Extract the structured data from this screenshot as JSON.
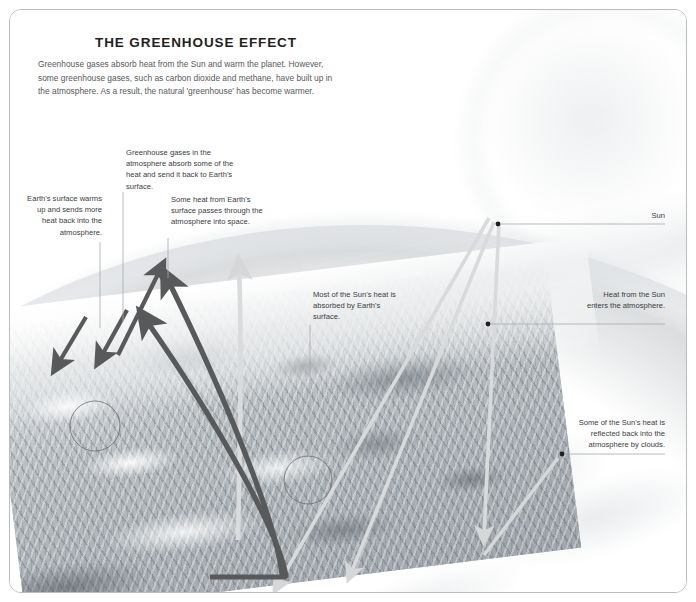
{
  "diagram": {
    "title": "THE GREENHOUSE EFFECT",
    "intro": "Greenhouse gases absorb heat from the Sun and warm the planet. However, some greenhouse gases, such as carbon dioxide and methane, have built up in the atmosphere. As a result, the natural 'greenhouse' has become warmer.",
    "background_subject": "earth-from-space-grayscale",
    "colors": {
      "title": "#231f20",
      "intro_text": "#58595b",
      "callout_text": "#3b3c3e",
      "leader_line": "#a7a9ac",
      "dark_arrow": "#58595b",
      "light_ray": "#d8dadc",
      "card_border": "#b9bcbe",
      "circle_marker": "#6d6e71"
    },
    "callouts": [
      {
        "id": "earth-surface-warms",
        "text": "Earth's surface warms up and sends more heat back into the atmosphere.",
        "align": "right"
      },
      {
        "id": "greenhouse-gases-absorb",
        "text": "Greenhouse gases in the atmosphere absorb some of the heat and send it back to Earth's surface.",
        "align": "left"
      },
      {
        "id": "heat-passes-into-space",
        "text": "Some heat from Earth's surface passes through the atmosphere into space.",
        "align": "left"
      },
      {
        "id": "most-heat-absorbed",
        "text": "Most of the Sun's heat is absorbed by Earth's surface.",
        "align": "left"
      },
      {
        "id": "sun",
        "text": "Sun",
        "align": "right"
      },
      {
        "id": "heat-enters-atmosphere",
        "text": "Heat from the Sun enters the atmosphere.",
        "align": "right"
      },
      {
        "id": "reflected-by-clouds",
        "text": "Some of the Sun's heat is reflected back into the atmosphere by clouds.",
        "align": "right"
      }
    ]
  }
}
